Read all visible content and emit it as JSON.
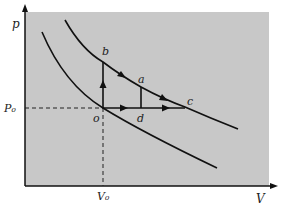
{
  "figure": {
    "type": "p-V diagram",
    "background_color": "#c8c8c8",
    "line_color": "#111111",
    "axes": {
      "y_label": "p",
      "x_label": "V",
      "y_tick_label": "P₀",
      "x_tick_label": "V₀"
    },
    "points": {
      "o": "o",
      "b": "b",
      "a": "a",
      "c": "c",
      "d": "d"
    },
    "curves": [
      {
        "name": "lower-isotherm",
        "description": "curve through point o"
      },
      {
        "name": "upper-isotherm",
        "description": "curve through points b, a, c"
      }
    ],
    "paths": [
      {
        "from": "o",
        "to": "b",
        "direction": "up"
      },
      {
        "from": "b",
        "to": "c",
        "direction": "along upper curve"
      },
      {
        "from": "o",
        "to": "c",
        "direction": "right, through d"
      },
      {
        "from": "d",
        "to": "a",
        "direction": "vertical segment"
      }
    ]
  }
}
